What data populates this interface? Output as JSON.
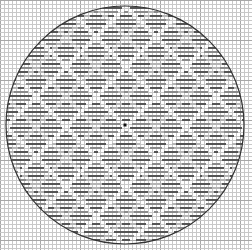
{
  "canvas": {
    "width": 252,
    "height": 250,
    "background": "#ffffff"
  },
  "grid": {
    "cell": 4,
    "color": "#c8c8c8",
    "major_every": 10,
    "major_color": "#a8a8a8"
  },
  "circle": {
    "cx": 125,
    "cy": 125,
    "r": 119,
    "stroke": "#333333",
    "width": 1.2
  },
  "center_mark": {
    "x": 125,
    "y": 125,
    "size": 3,
    "color": "#111111"
  },
  "pattern": {
    "type": "diamond-lattice",
    "stitch_row_height": 4,
    "dash_color_dark": "#555555",
    "dash_color_mid": "#8a8a8a",
    "dash_color_light": "#b5b5b5",
    "diamond_period": 60,
    "band_width": 7,
    "inner_diamond_period": 30
  }
}
